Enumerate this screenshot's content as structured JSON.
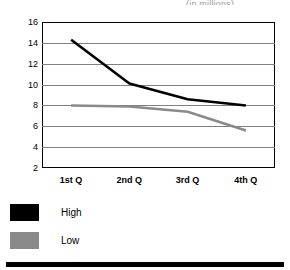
{
  "chart_data": {
    "type": "line",
    "title": "",
    "subtitle": "(in millions)",
    "xlabel": "",
    "ylabel": "",
    "categories": [
      "1st Q",
      "2nd Q",
      "3rd Q",
      "4th Q"
    ],
    "series": [
      {
        "name": "High",
        "color": "#000000",
        "values": [
          14.3,
          10.1,
          8.6,
          8.0
        ]
      },
      {
        "name": "Low",
        "color": "#8a8a8a",
        "values": [
          8.0,
          7.9,
          7.4,
          5.6
        ]
      }
    ],
    "ylim": [
      2,
      16
    ],
    "yticks": [
      16,
      14,
      12,
      10,
      8,
      6,
      4,
      2
    ],
    "ytick_labels": [
      "16",
      "14",
      "12",
      "10",
      "8",
      "6",
      "4",
      "2"
    ],
    "grid": true,
    "grid_color": "#808080",
    "legend_position": "below-left",
    "frame_color": "#000000",
    "background": "#ffffff"
  },
  "legend": {
    "items": [
      {
        "label": "High",
        "color": "#000000"
      },
      {
        "label": "Low",
        "color": "#8a8a8a"
      }
    ]
  }
}
